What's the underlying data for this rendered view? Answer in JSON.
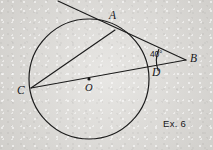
{
  "figure": {
    "caption": "Ex. 6",
    "background_color": "#dcdad6",
    "ink_color": "#1b1b1b",
    "width": 213,
    "height": 150
  },
  "labels": {
    "point_a": "A",
    "point_b": "B",
    "point_c": "C",
    "point_d": "D",
    "center_o": "O",
    "angle_b": "40°"
  },
  "geometry": {
    "circle": {
      "cx": 89,
      "cy": 79,
      "r": 60
    },
    "points": {
      "A": {
        "x": 115,
        "y": 30
      },
      "B": {
        "x": 186,
        "y": 60
      },
      "C": {
        "x": 31,
        "y": 88
      },
      "D": {
        "x": 148,
        "y": 66
      },
      "O": {
        "x": 89,
        "y": 79
      }
    },
    "tangent_line_start": {
      "x": 58,
      "y": 1
    },
    "angle_arc": {
      "vertex": "B",
      "degrees": 40,
      "radius": 28
    }
  }
}
